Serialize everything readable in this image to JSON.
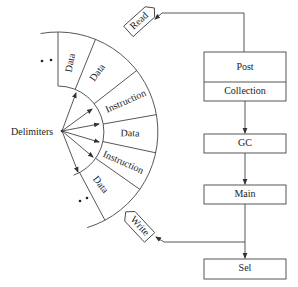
{
  "diagram": {
    "hub_label": "Delimiters",
    "segments": [
      {
        "label": "Data"
      },
      {
        "label": "Data"
      },
      {
        "label": "Instruction"
      },
      {
        "label": "Data"
      },
      {
        "label": "Instruction"
      },
      {
        "label": "Data"
      }
    ],
    "ellipsis_top": "• •",
    "ellipsis_bottom": "• •",
    "tags": {
      "read": "Read",
      "write": "Write"
    },
    "boxes": {
      "post": "Post",
      "collection": "Collection",
      "gc": "GC",
      "main": "Main",
      "sel": "Sel"
    },
    "colors": {
      "line": "#444444",
      "text": "#222222",
      "background": "#ffffff"
    }
  }
}
